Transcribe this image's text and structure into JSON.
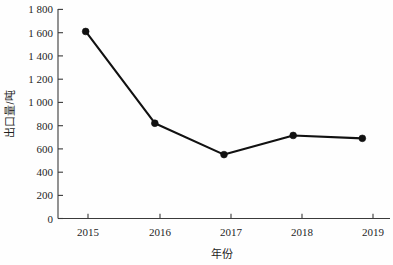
{
  "chart_data": {
    "type": "line",
    "title": "",
    "subtitle": "",
    "xlabel": "年份",
    "ylabel": "出口量/吨",
    "categories": [
      "2015",
      "2016",
      "2017",
      "2018",
      "2019"
    ],
    "x": [
      2015,
      2016,
      2017,
      2018,
      2019
    ],
    "values": [
      1610,
      820,
      550,
      715,
      690
    ],
    "series": [
      {
        "name": "出口量",
        "values": [
          1610,
          820,
          550,
          715,
          690
        ]
      }
    ],
    "xlim": [
      2014.6,
      2019.4
    ],
    "ylim": [
      0,
      1800
    ],
    "ytick_labels": [
      "0",
      "200",
      "400",
      "600",
      "800",
      "1 000",
      "1 200",
      "1 400",
      "1 600",
      "1 800"
    ],
    "ytick_values": [
      0,
      200,
      400,
      600,
      800,
      1000,
      1200,
      1400,
      1600,
      1800
    ],
    "xtick_labels": [
      "2015",
      "2016",
      "2017",
      "2018",
      "2019"
    ],
    "grid": false,
    "legend": false,
    "legend_position": "none",
    "marker": "circle",
    "line_color": "#111111",
    "marker_color": "#111111",
    "axis_color": "#3a3a3a",
    "background_color": "#fefefe"
  },
  "labels": {
    "y_axis_title": "出口量/吨",
    "x_axis_title": "年份",
    "y_ticks": [
      "1 800",
      "1 600",
      "1 400",
      "1 200",
      "1 000",
      "800",
      "600",
      "400",
      "200",
      "0"
    ],
    "x_ticks": [
      "2015",
      "2016",
      "2017",
      "2018",
      "2019"
    ]
  }
}
